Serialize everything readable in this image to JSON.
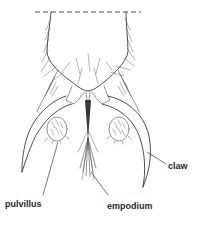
{
  "figure": {
    "labels": [
      {
        "id": "claw",
        "text": "claw"
      },
      {
        "id": "pulvillus",
        "text": "pulvillus"
      },
      {
        "id": "empodium",
        "text": "empodium"
      }
    ]
  },
  "labels": {
    "claw": "claw",
    "pulvillus": "pulvillus",
    "empodium": "empodium"
  }
}
